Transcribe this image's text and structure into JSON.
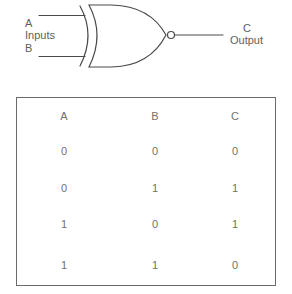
{
  "diagram": {
    "gate": {
      "symbol": "xnor-gate-icon",
      "inputs_label": "Inputs",
      "input_a_label": "A",
      "input_b_label": "B",
      "output_top_label": "C",
      "output_label": "Output",
      "stroke_color": "#4a4a4a"
    },
    "truth_table": {
      "headers": [
        "A",
        "B",
        "C"
      ],
      "rows": [
        [
          "0",
          "0",
          "0"
        ],
        [
          "0",
          "1",
          "1"
        ],
        [
          "1",
          "0",
          "1"
        ],
        [
          "1",
          "1",
          "0"
        ]
      ],
      "border_color": "#6a6a6a"
    }
  }
}
